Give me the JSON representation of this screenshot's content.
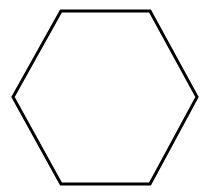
{
  "canvas": {
    "width": 209,
    "height": 194,
    "background_color": "#ffffff",
    "alt_text": "Hexagon outline"
  },
  "figure": {
    "name": "hexagon",
    "shape_type": "polygon",
    "sides": 6,
    "orientation": "pointy-left-right",
    "fill_color": "#ffffff",
    "stroke_color": "#000000",
    "stroke_width": 3,
    "stroke_linejoin": "miter",
    "points": "61,11 150,11 197,97 150,184 61,184 13,97",
    "vertices": [
      {
        "label": "top-left",
        "x": 61,
        "y": 11
      },
      {
        "label": "top-right",
        "x": 150,
        "y": 11
      },
      {
        "label": "right",
        "x": 197,
        "y": 97
      },
      {
        "label": "bottom-right",
        "x": 150,
        "y": 184
      },
      {
        "label": "bottom-left",
        "x": 61,
        "y": 184
      },
      {
        "label": "left",
        "x": 13,
        "y": 97
      }
    ]
  }
}
